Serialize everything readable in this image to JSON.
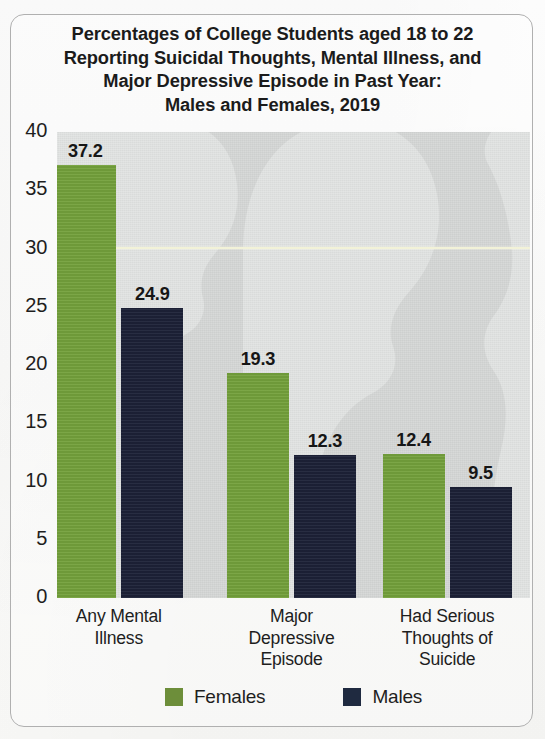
{
  "figure": {
    "title_lines": [
      "Percentages of College Students aged 18 to 22",
      "Reporting Suicidal Thoughts, Mental Illness, and",
      "Major Depressive Episode in Past Year:",
      "Males and Females, 2019"
    ],
    "watermark": "human-profile-silhouettes",
    "border_color": "#b0b0b0",
    "plot_background": "#d4d6d5",
    "gridline_color": "#f2f2d8"
  },
  "colors": {
    "females_bar": "#74a13c",
    "males_bar": "#1c2137",
    "females_legend_swatch": "#6d8e3a",
    "males_legend_swatch": "#1f2a40"
  },
  "chart_data": {
    "type": "bar",
    "title": "Percentages of College Students aged 18 to 22 Reporting Suicidal Thoughts, Mental Illness, and Major Depressive Episode in Past Year: Males and Females, 2019",
    "xlabel": "",
    "ylabel": "",
    "ylim": [
      0,
      40
    ],
    "yticks": [
      "0",
      "5",
      "10",
      "15",
      "20",
      "25",
      "30",
      "35",
      "40"
    ],
    "ytick_values": [
      0,
      5,
      10,
      15,
      20,
      25,
      30,
      35,
      40
    ],
    "gridlines": [
      30
    ],
    "grid": true,
    "legend_position": "bottom",
    "categories": [
      "Any Mental\nIllness",
      "Major\nDepressive\nEpisode",
      "Had Serious\nThoughts of\nSuicide"
    ],
    "category_lines": [
      [
        "Any Mental",
        "Illness"
      ],
      [
        "Major",
        "Depressive",
        "Episode"
      ],
      [
        "Had Serious",
        "Thoughts of",
        "Suicide"
      ]
    ],
    "series": [
      {
        "name": "Females",
        "color": "#74a13c",
        "values": [
          37.2,
          19.3,
          12.4
        ],
        "labels": [
          "37.2",
          "19.3",
          "12.4"
        ]
      },
      {
        "name": "Males",
        "color": "#1c2137",
        "values": [
          24.9,
          12.3,
          9.5
        ],
        "labels": [
          "24.9",
          "12.3",
          "9.5"
        ]
      }
    ]
  },
  "legend": {
    "items": [
      {
        "label": "Females",
        "key": "f"
      },
      {
        "label": "Males",
        "key": "m"
      }
    ]
  }
}
